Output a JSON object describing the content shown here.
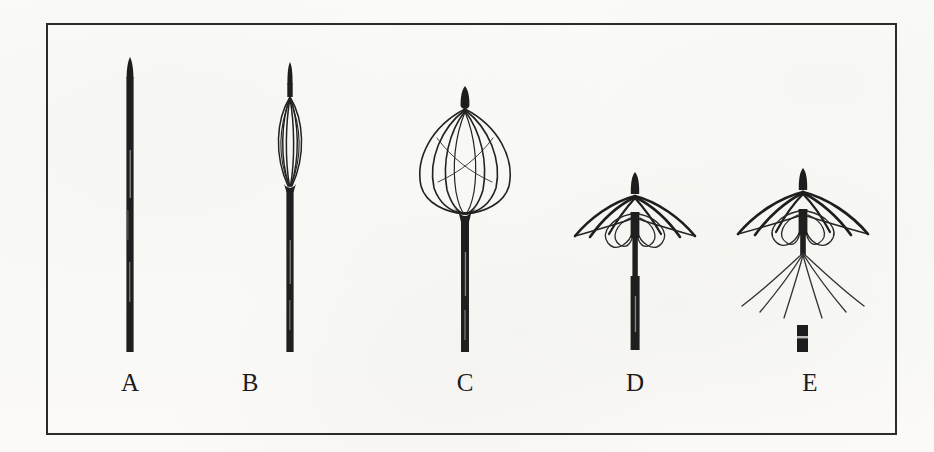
{
  "figure": {
    "caption_present": false,
    "frame": {
      "x": 46,
      "y": 23,
      "width": 851,
      "height": 412,
      "border_color": "#2b2b2b",
      "border_width": 2
    },
    "background_color": "#fbfbf9",
    "ink_color": "#1c1c1c",
    "panel_count": 5
  },
  "panels": [
    {
      "id": "A",
      "label": "A",
      "label_x": 130,
      "label_y": 382,
      "description": "closed undeployed filter within delivery sheath, straight narrow dark shaft with tapered tip",
      "state": "closed",
      "axis_x": 130,
      "shaft_top": 57,
      "shaft_bottom": 352,
      "shaft_width": 7,
      "has_basket": false,
      "has_umbrella": false,
      "has_legs": false,
      "has_detached_tip": false
    },
    {
      "id": "B",
      "label": "B",
      "label_x": 250,
      "label_y": 382,
      "description": "partially expanded filter forming a narrow elongated spindle of wires near the tip",
      "state": "partially-expanded",
      "axis_x": 290,
      "shaft_top": 62,
      "shaft_bottom": 352,
      "shaft_width": 7,
      "has_basket": true,
      "basket_top": 95,
      "basket_bottom": 185,
      "basket_half_width": 17,
      "wire_count": 6,
      "has_umbrella": false,
      "has_legs": false,
      "has_detached_tip": false
    },
    {
      "id": "C",
      "label": "C",
      "label_x": 465,
      "label_y": 382,
      "description": "fully expanded ovoid wire basket between apex hub and lower convergence, shaft below",
      "state": "expanded-basket",
      "axis_x": 465,
      "shaft_top": 86,
      "shaft_bottom": 352,
      "shaft_width": 8,
      "has_basket": true,
      "basket_top": 108,
      "basket_bottom": 215,
      "basket_half_width": 48,
      "wire_count": 6,
      "has_umbrella": false,
      "has_legs": false,
      "has_detached_tip": false
    },
    {
      "id": "D",
      "label": "D",
      "label_x": 635,
      "label_y": 382,
      "description": "umbrella configuration, wire arms splayed outward and downward from top hub with curved loops beneath, shaft continuing below",
      "state": "umbrella",
      "axis_x": 635,
      "shaft_top": 172,
      "shaft_bottom": 350,
      "shaft_width": 8,
      "has_basket": false,
      "has_umbrella": true,
      "umbrella_hub_y": 196,
      "umbrella_rim_y": 238,
      "umbrella_half_width": 62,
      "arm_count": 6,
      "has_legs": false,
      "has_detached_tip": false
    },
    {
      "id": "E",
      "label": "E",
      "label_x": 810,
      "label_y": 382,
      "description": "fully deployed filter released from delivery system: upper umbrella of arms plus long thin legs splaying downward, detached catheter tip shown separately below",
      "state": "deployed-released",
      "axis_x": 803,
      "shaft_top": 168,
      "shaft_bottom": 252,
      "shaft_width": 8,
      "has_basket": false,
      "has_umbrella": true,
      "umbrella_hub_y": 192,
      "umbrella_rim_y": 236,
      "umbrella_half_width": 68,
      "arm_count": 6,
      "has_legs": true,
      "leg_count": 6,
      "leg_origin_y": 252,
      "leg_tip_y": 316,
      "leg_half_width": 68,
      "has_detached_tip": true,
      "detached_tip": {
        "x": 797,
        "y": 325,
        "width": 11,
        "height": 27
      }
    }
  ]
}
